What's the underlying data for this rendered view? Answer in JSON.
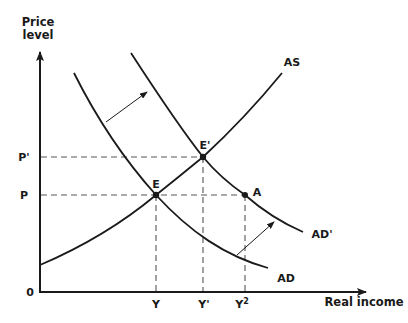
{
  "diagram": {
    "type": "economics AD-AS diagram",
    "y_axis": {
      "title_line1": "Price",
      "title_line2": "level"
    },
    "x_axis": {
      "title": "Real income"
    },
    "origin_label": "0",
    "curves": [
      {
        "id": "AS",
        "label": "AS"
      },
      {
        "id": "AD",
        "label": "AD"
      },
      {
        "id": "AD_prime",
        "label": "AD'"
      }
    ],
    "points": [
      {
        "id": "E",
        "label": "E",
        "on": [
          "AS",
          "AD"
        ]
      },
      {
        "id": "E_prime",
        "label": "E'",
        "on": [
          "AS",
          "AD'"
        ]
      },
      {
        "id": "A",
        "label": "A",
        "on": [
          "AD'"
        ]
      }
    ],
    "price_labels": {
      "p": "P",
      "p_prime": "P'"
    },
    "income_labels": {
      "y": "Y",
      "y_prime": "Y'",
      "y2_base": "Y",
      "y2_sup": "2"
    },
    "shift_arrows": [
      {
        "from": "AD",
        "to": "AD'",
        "position": "upper"
      },
      {
        "from": "AD",
        "to": "AD'",
        "position": "lower"
      }
    ]
  }
}
